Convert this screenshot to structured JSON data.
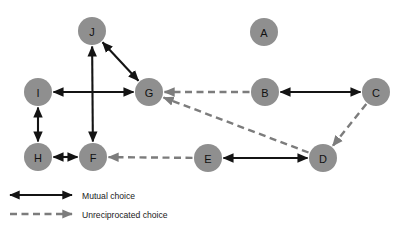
{
  "figure": {
    "type": "sociogram",
    "background_color": "#ffffff",
    "node_color": "#8f8f8f",
    "node_label_color": "#111111",
    "mutual_edge_color": "#141414",
    "unreciprocated_edge_color": "#7c7c7c",
    "node_radius": 14
  },
  "nodes": [
    {
      "id": "J",
      "label": "J",
      "x": 92,
      "y": 31
    },
    {
      "id": "A",
      "label": "A",
      "x": 264,
      "y": 32
    },
    {
      "id": "I",
      "label": "I",
      "x": 38,
      "y": 92
    },
    {
      "id": "G",
      "label": "G",
      "x": 149,
      "y": 92
    },
    {
      "id": "B",
      "label": "B",
      "x": 265,
      "y": 92
    },
    {
      "id": "C",
      "label": "C",
      "x": 376,
      "y": 92
    },
    {
      "id": "H",
      "label": "H",
      "x": 38,
      "y": 157
    },
    {
      "id": "F",
      "label": "F",
      "x": 93,
      "y": 157
    },
    {
      "id": "E",
      "label": "E",
      "x": 208,
      "y": 158
    },
    {
      "id": "D",
      "label": "D",
      "x": 323,
      "y": 158
    }
  ],
  "edges": [
    {
      "from": "J",
      "to": "G",
      "kind": "mutual"
    },
    {
      "from": "J",
      "to": "F",
      "kind": "mutual"
    },
    {
      "from": "I",
      "to": "G",
      "kind": "mutual"
    },
    {
      "from": "I",
      "to": "H",
      "kind": "mutual"
    },
    {
      "from": "H",
      "to": "F",
      "kind": "mutual"
    },
    {
      "from": "B",
      "to": "C",
      "kind": "mutual"
    },
    {
      "from": "E",
      "to": "D",
      "kind": "mutual"
    },
    {
      "from": "B",
      "to": "G",
      "kind": "unreciprocated"
    },
    {
      "from": "D",
      "to": "G",
      "kind": "unreciprocated"
    },
    {
      "from": "C",
      "to": "D",
      "kind": "unreciprocated"
    },
    {
      "from": "E",
      "to": "F",
      "kind": "unreciprocated"
    }
  ],
  "isolates": [
    "A"
  ],
  "legend": {
    "items": [
      {
        "key": "mutual",
        "label": "Mutual choice",
        "style": "solid-double-arrow"
      },
      {
        "key": "unreciprocated",
        "label": "Unreciprocated choice",
        "style": "dashed-single-arrow"
      }
    ]
  }
}
